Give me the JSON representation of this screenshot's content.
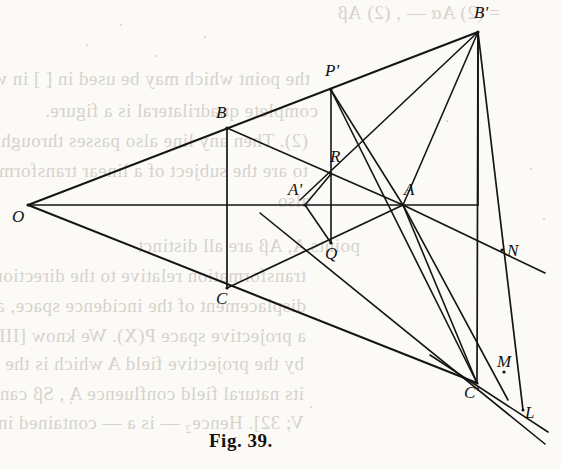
{
  "figure": {
    "caption": "Fig. 39.",
    "caption_x": 209,
    "caption_y": 430,
    "background_color": "#fbfaf7",
    "ink_color": "#151515",
    "bleed_color": "#b9b3aa"
  },
  "points": [
    {
      "id": "O",
      "label": "O",
      "x": 28,
      "y": 205,
      "label_x": 12,
      "label_y": 208
    },
    {
      "id": "B",
      "label": "B",
      "x": 227,
      "y": 128,
      "label_x": 216,
      "label_y": 104
    },
    {
      "id": "C",
      "label": "C",
      "x": 227,
      "y": 288,
      "label_x": 216,
      "label_y": 290
    },
    {
      "id": "A",
      "label": "A",
      "x": 403,
      "y": 205,
      "label_x": 404,
      "label_y": 181
    },
    {
      "id": "Ap",
      "label": "A'",
      "x": 305,
      "y": 205,
      "label_x": 288,
      "label_y": 181
    },
    {
      "id": "Bp",
      "label": "B'",
      "x": 478,
      "y": 32,
      "label_x": 474,
      "label_y": 4
    },
    {
      "id": "Cp",
      "label": "C'",
      "x": 477,
      "y": 383,
      "label_x": 464,
      "label_y": 384
    },
    {
      "id": "Pp",
      "label": "P'",
      "x": 331,
      "y": 90,
      "label_x": 325,
      "label_y": 62
    },
    {
      "id": "R",
      "label": "R",
      "x": 331,
      "y": 174,
      "label_x": 330,
      "label_y": 148
    },
    {
      "id": "Q",
      "label": "Q",
      "x": 331,
      "y": 243,
      "label_x": 325,
      "label_y": 245
    },
    {
      "id": "N",
      "label": "N",
      "x": 502,
      "y": 250,
      "label_x": 507,
      "label_y": 242
    },
    {
      "id": "M",
      "label": "M",
      "x": 504,
      "y": 372,
      "label_x": 497,
      "label_y": 353
    },
    {
      "id": "L",
      "label": "L",
      "x": 523,
      "y": 410,
      "label_x": 525,
      "label_y": 404
    }
  ],
  "segments": [
    {
      "name": "O-to-Bprime-ray",
      "x1": 28,
      "y1": 205,
      "x2": 478,
      "y2": 32,
      "w": 2.0
    },
    {
      "name": "O-to-Cprime-ray",
      "x1": 28,
      "y1": 205,
      "x2": 477,
      "y2": 383,
      "w": 2.0
    },
    {
      "name": "O-to-A-axis",
      "x1": 28,
      "y1": 205,
      "x2": 478,
      "y2": 205,
      "w": 1.7
    },
    {
      "name": "B-to-C-vertical",
      "x1": 227,
      "y1": 128,
      "x2": 227,
      "y2": 288,
      "w": 1.7
    },
    {
      "name": "B-to-A-side",
      "x1": 227,
      "y1": 128,
      "x2": 403,
      "y2": 205,
      "w": 1.7
    },
    {
      "name": "C-to-A-side",
      "x1": 227,
      "y1": 288,
      "x2": 403,
      "y2": 205,
      "w": 1.7
    },
    {
      "name": "Pprime-to-Q-vert",
      "x1": 331,
      "y1": 90,
      "x2": 331,
      "y2": 243,
      "w": 1.6
    },
    {
      "name": "Aprime-to-R",
      "x1": 305,
      "y1": 205,
      "x2": 331,
      "y2": 174,
      "w": 1.6
    },
    {
      "name": "Aprime-to-Q",
      "x1": 305,
      "y1": 205,
      "x2": 331,
      "y2": 243,
      "w": 1.6
    },
    {
      "name": "Pprime-to-A",
      "x1": 331,
      "y1": 90,
      "x2": 403,
      "y2": 205,
      "w": 1.6
    },
    {
      "name": "Pprime-to-Cprime",
      "x1": 331,
      "y1": 90,
      "x2": 477,
      "y2": 383,
      "w": 1.6
    },
    {
      "name": "Bprime-to-A",
      "x1": 478,
      "y1": 32,
      "x2": 403,
      "y2": 205,
      "w": 1.6
    },
    {
      "name": "Bprime-to-R-ext",
      "x1": 478,
      "y1": 32,
      "x2": 300,
      "y2": 200,
      "w": 1.6
    },
    {
      "name": "Bprime-to-Cprime",
      "x1": 478,
      "y1": 32,
      "x2": 477,
      "y2": 383,
      "w": 1.7
    },
    {
      "name": "Bprime-to-L",
      "x1": 478,
      "y1": 32,
      "x2": 523,
      "y2": 410,
      "w": 1.7
    },
    {
      "name": "A-to-Cprime",
      "x1": 403,
      "y1": 205,
      "x2": 477,
      "y2": 383,
      "w": 1.6
    },
    {
      "name": "A-to-M-ray",
      "x1": 403,
      "y1": 205,
      "x2": 508,
      "y2": 400,
      "w": 1.6
    },
    {
      "name": "A-to-N-ray",
      "x1": 403,
      "y1": 205,
      "x2": 545,
      "y2": 273,
      "w": 1.6
    },
    {
      "name": "Q-to-Cprime-ray",
      "x1": 260,
      "y1": 213,
      "x2": 545,
      "y2": 444,
      "w": 1.6
    },
    {
      "name": "Cprime-to-L-ext",
      "x1": 430,
      "y1": 355,
      "x2": 548,
      "y2": 432,
      "w": 1.6
    },
    {
      "name": "A-vert-to-axis",
      "x1": 478,
      "y1": 205,
      "x2": 478,
      "y2": 32,
      "w": 1.6
    }
  ],
  "bleed_text": [
    {
      "text": "= (2) Aα — ,  (2) Aβ",
      "x": 200,
      "y": 2,
      "size": 19
    },
    {
      "text": "the point which may be used in [ ] in which the",
      "x": 10,
      "y": 68,
      "size": 19
    },
    {
      "text": "complete quadrilateral is a figure.",
      "x": 18,
      "y": 100,
      "size": 19
    },
    {
      "text": "(2).  Then any line also passes through the",
      "x": 8,
      "y": 130,
      "size": 19
    },
    {
      "text": "to  are the subject of a linear transformation",
      "x": 8,
      "y": 160,
      "size": 19
    },
    {
      "text": "also",
      "x": 10,
      "y": 190,
      "size": 19
    },
    {
      "text": "points  A,  Aβ  are all distinct",
      "x": 60,
      "y": 235,
      "size": 19
    },
    {
      "text": "transformation relative to the direction",
      "x": 6,
      "y": 265,
      "size": 19
    },
    {
      "text": "displacement of the incidence space, and",
      "x": 6,
      "y": 295,
      "size": 19
    },
    {
      "text": "a projective space  P(X).  We know [III; 57],",
      "x": 6,
      "y": 325,
      "size": 19
    },
    {
      "text": "by the projective field A  which is the intersection",
      "x": 4,
      "y": 353,
      "size": 19
    },
    {
      "text": "its natural field confluence  A , Sβ  can entirely",
      "x": 4,
      "y": 383,
      "size": 19
    },
    {
      "text": "V; 32].  Hence₂   — is a  — contained in  the",
      "x": 4,
      "y": 412,
      "size": 19
    }
  ],
  "specks": [
    {
      "x": 86,
      "y": 44,
      "d": 2
    },
    {
      "x": 204,
      "y": 36,
      "d": 2
    },
    {
      "x": 120,
      "y": 24,
      "d": 2
    },
    {
      "x": 155,
      "y": 55,
      "d": 2
    },
    {
      "x": 262,
      "y": 330,
      "d": 2
    },
    {
      "x": 310,
      "y": 406,
      "d": 2
    },
    {
      "x": 530,
      "y": 168,
      "d": 2
    },
    {
      "x": 543,
      "y": 218,
      "d": 2
    },
    {
      "x": 70,
      "y": 402,
      "d": 2
    },
    {
      "x": 446,
      "y": 120,
      "d": 2
    }
  ]
}
